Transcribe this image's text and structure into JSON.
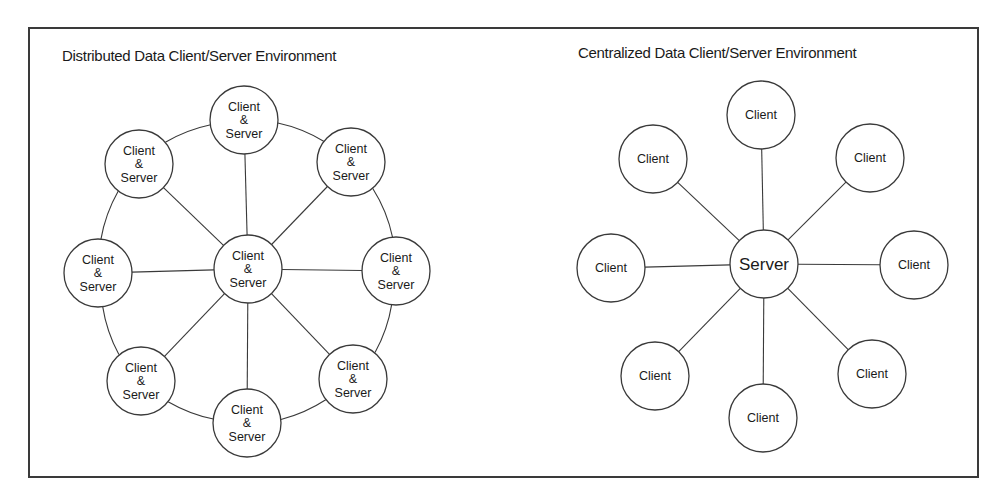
{
  "left_diagram": {
    "title": "Distributed Data Client/Server Environment",
    "node_label_lines": [
      "Client",
      "&",
      "Server"
    ],
    "nodes": [
      {
        "id": "top",
        "x": 244,
        "y": 120,
        "label": "Client & Server"
      },
      {
        "id": "upper-right",
        "x": 351,
        "y": 162,
        "label": "Client & Server"
      },
      {
        "id": "right",
        "x": 396,
        "y": 271,
        "label": "Client & Server"
      },
      {
        "id": "lower-right",
        "x": 353,
        "y": 379,
        "label": "Client & Server"
      },
      {
        "id": "bottom",
        "x": 247,
        "y": 423,
        "label": "Client & Server"
      },
      {
        "id": "lower-left",
        "x": 141,
        "y": 381,
        "label": "Client & Server"
      },
      {
        "id": "left",
        "x": 98,
        "y": 273,
        "label": "Client & Server"
      },
      {
        "id": "upper-left",
        "x": 139,
        "y": 164,
        "label": "Client & Server"
      }
    ],
    "center": {
      "id": "center",
      "x": 248,
      "y": 269,
      "label": "Client & Server"
    },
    "radius": 34
  },
  "right_diagram": {
    "title": "Centralized Data Client/Server Environment",
    "client_label": "Client",
    "server_label": "Server",
    "nodes": [
      {
        "id": "top",
        "x": 761,
        "y": 115,
        "label": "Client"
      },
      {
        "id": "upper-right",
        "x": 870,
        "y": 158,
        "label": "Client"
      },
      {
        "id": "right",
        "x": 914,
        "y": 265,
        "label": "Client"
      },
      {
        "id": "lower-right",
        "x": 872,
        "y": 374,
        "label": "Client"
      },
      {
        "id": "bottom",
        "x": 763,
        "y": 418,
        "label": "Client"
      },
      {
        "id": "lower-left",
        "x": 655,
        "y": 376,
        "label": "Client"
      },
      {
        "id": "left",
        "x": 611,
        "y": 268,
        "label": "Client"
      },
      {
        "id": "upper-left",
        "x": 653,
        "y": 159,
        "label": "Client"
      }
    ],
    "center": {
      "id": "server",
      "x": 764,
      "y": 264,
      "label": "Server"
    },
    "radius": 34
  },
  "colors": {
    "stroke": "#3a3a3a",
    "text": "#1a1a1a",
    "background": "#ffffff"
  }
}
